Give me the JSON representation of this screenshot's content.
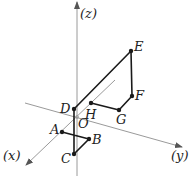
{
  "diagram": {
    "type": "3d-coordinate-path",
    "axes": {
      "x": {
        "label": "(x)",
        "from": [
          115,
          80
        ],
        "to": [
          26,
          165
        ],
        "label_pos": [
          3,
          160
        ]
      },
      "y": {
        "label": "(y)",
        "from": [
          25,
          103
        ],
        "to": [
          182,
          147
        ],
        "label_pos": [
          171,
          160
        ]
      },
      "z": {
        "label": "(z)",
        "from": [
          77,
          176
        ],
        "to": [
          77,
          2
        ],
        "label_pos": [
          80,
          18
        ]
      }
    },
    "origin": {
      "label": "O",
      "pos": [
        77,
        117
      ],
      "label_pos": [
        78,
        128
      ]
    },
    "points": [
      {
        "name": "A",
        "pos": [
          62,
          132
        ],
        "label_pos": [
          50,
          134
        ]
      },
      {
        "name": "B",
        "pos": [
          89,
          139
        ],
        "label_pos": [
          92,
          144
        ]
      },
      {
        "name": "C",
        "pos": [
          74,
          154
        ],
        "label_pos": [
          61,
          163
        ]
      },
      {
        "name": "D",
        "pos": [
          74,
          109
        ],
        "label_pos": [
          60,
          113
        ]
      },
      {
        "name": "E",
        "pos": [
          131,
          51
        ],
        "label_pos": [
          134,
          51
        ]
      },
      {
        "name": "F",
        "pos": [
          132,
          96
        ],
        "label_pos": [
          135,
          100
        ]
      },
      {
        "name": "G",
        "pos": [
          119,
          110
        ],
        "label_pos": [
          116,
          124
        ]
      },
      {
        "name": "H",
        "pos": [
          91,
          103
        ],
        "label_pos": [
          85,
          119
        ]
      }
    ],
    "path_order": [
      "A",
      "B",
      "C",
      "D",
      "E",
      "F",
      "G",
      "H"
    ],
    "colors": {
      "axis": "#9a9a9a",
      "path": "#1a1a1a",
      "text": "#222222"
    }
  }
}
